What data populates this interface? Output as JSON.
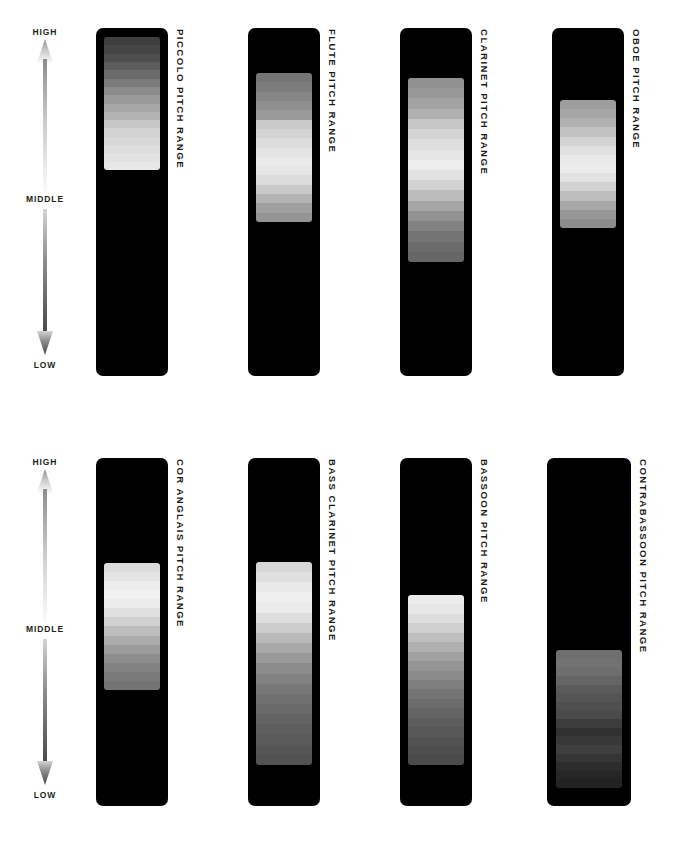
{
  "figure": {
    "background_color": "#ffffff",
    "card_color": "#000000",
    "label_color": "#1a1a1a"
  },
  "axis": {
    "high_label": "HIGH",
    "middle_label": "MIDDLE",
    "low_label": "LOW",
    "up_arrow_icon": "arrow-up-icon",
    "down_arrow_icon": "arrow-down-icon",
    "up_arrow_gradient": [
      "#8c8c8c",
      "#fdfdfd"
    ],
    "down_arrow_gradient": [
      "#d9d9d9",
      "#4a4a4a"
    ]
  },
  "chart_data": {
    "type": "bar",
    "subtitle": "Relative pitch span of each woodwind instrument",
    "xlabel": "",
    "ylabel": "Pitch",
    "grid": false,
    "legend": "none",
    "orientation": "vertical",
    "scale_labels": [
      "HIGH",
      "MIDDLE",
      "LOW"
    ],
    "ylim": [
      0,
      100
    ],
    "categories": [
      "PICCOLO",
      "FLUTE",
      "CLARINET",
      "OBOE",
      "COR ANGLAIS",
      "BASS CLARINET",
      "BASSOON",
      "CONTRABASSOON"
    ],
    "series": [
      {
        "name": "range_top_pct",
        "values": [
          97,
          87,
          86,
          79,
          70,
          70,
          61,
          45
        ]
      },
      {
        "name": "range_bottom_pct",
        "values": [
          59,
          44,
          33,
          42,
          33,
          12,
          12,
          4
        ]
      },
      {
        "name": "range_span_pct",
        "values": [
          38,
          43,
          53,
          37,
          37,
          58,
          49,
          41
        ]
      }
    ]
  },
  "row1": {
    "axis": {
      "high_label": "HIGH",
      "middle_label": "MIDDLE",
      "low_label": "LOW"
    },
    "instruments": [
      {
        "id": "piccolo",
        "label": "PICCOLO PITCH RANGE",
        "name": "PICCOLO",
        "card": {
          "x": 96,
          "y": 28,
          "w": 72,
          "h": 348
        },
        "bar": {
          "x": 8,
          "y": 9,
          "w": 56,
          "h": 133
        },
        "bands": [
          "#3e3e3e",
          "#454545",
          "#4e4e4e",
          "#5c5c5c",
          "#6b6b6b",
          "#7b7b7b",
          "#8b8b8b",
          "#9a9a9a",
          "#a7a7a7",
          "#b3b3b3",
          "#c7c7c7",
          "#d2d2d2",
          "#d8d8d8",
          "#dddddd",
          "#e2e2e2",
          "#e8e8e8"
        ]
      },
      {
        "id": "flute",
        "label": "FLUTE PITCH RANGE",
        "name": "FLUTE",
        "card": {
          "x": 248,
          "y": 28,
          "w": 72,
          "h": 348
        },
        "bar": {
          "x": 8,
          "y": 45,
          "w": 56,
          "h": 149
        },
        "bands": [
          "#757575",
          "#7c7c7c",
          "#868686",
          "#8f8f8f",
          "#9a9a9a",
          "#cacaca",
          "#d4d4d4",
          "#dddddd",
          "#e4e4e4",
          "#eaeaea",
          "#e6e6e6",
          "#dcdcdc",
          "#c9c9c9",
          "#b4b4b4",
          "#a0a0a0",
          "#949494"
        ]
      },
      {
        "id": "clarinet",
        "label": "CLARINET PITCH RANGE",
        "name": "CLARINET",
        "card": {
          "x": 400,
          "y": 28,
          "w": 72,
          "h": 348
        },
        "bar": {
          "x": 8,
          "y": 50,
          "w": 56,
          "h": 184
        },
        "bands": [
          "#909090",
          "#989898",
          "#a3a3a3",
          "#b0b0b0",
          "#c6c6c6",
          "#d4d4d4",
          "#dedede",
          "#e6e6e6",
          "#ededed",
          "#e2e2e2",
          "#d2d2d2",
          "#bcbcbc",
          "#a6a6a6",
          "#929292",
          "#828282",
          "#747474",
          "#6b6b6b",
          "#666666"
        ]
      },
      {
        "id": "oboe",
        "label": "OBOE PITCH RANGE",
        "name": "OBOE",
        "card": {
          "x": 552,
          "y": 28,
          "w": 72,
          "h": 348
        },
        "bar": {
          "x": 8,
          "y": 72,
          "w": 56,
          "h": 128
        },
        "bands": [
          "#9d9d9d",
          "#a6a6a6",
          "#b1b1b1",
          "#c2c2c2",
          "#d3d3d3",
          "#e0e0e0",
          "#e9e9e9",
          "#ececec",
          "#e2e2e2",
          "#d2d2d2",
          "#bdbdbd",
          "#a8a8a8",
          "#979797",
          "#8c8c8c"
        ]
      }
    ]
  },
  "row2": {
    "axis": {
      "high_label": "HIGH",
      "middle_label": "MIDDLE",
      "low_label": "LOW"
    },
    "instruments": [
      {
        "id": "cor-anglais",
        "label": "COR ANGLAIS PITCH RANGE",
        "name": "COR ANGLAIS",
        "card": {
          "x": 96,
          "y": 28,
          "w": 72,
          "h": 348
        },
        "bar": {
          "x": 8,
          "y": 105,
          "w": 56,
          "h": 127
        },
        "bands": [
          "#dcdcdc",
          "#e4e4e4",
          "#ececec",
          "#f1f1f1",
          "#ececec",
          "#e0e0e0",
          "#d0d0d0",
          "#bdbdbd",
          "#ababab",
          "#9b9b9b",
          "#8d8d8d",
          "#828282",
          "#7a7a7a",
          "#747474"
        ]
      },
      {
        "id": "bass-clarinet",
        "label": "BASS CLARINET PITCH RANGE",
        "name": "BASS CLARINET",
        "card": {
          "x": 248,
          "y": 28,
          "w": 72,
          "h": 348
        },
        "bar": {
          "x": 8,
          "y": 104,
          "w": 56,
          "h": 203
        },
        "bands": [
          "#d6d6d6",
          "#e0e0e0",
          "#e9e9e9",
          "#efefef",
          "#ebebeb",
          "#dedede",
          "#cccccc",
          "#b9b9b9",
          "#a8a8a8",
          "#999999",
          "#8c8c8c",
          "#818181",
          "#787878",
          "#707070",
          "#696969",
          "#636363",
          "#5e5e5e",
          "#5a5a5a",
          "#565656",
          "#525252"
        ]
      },
      {
        "id": "bassoon",
        "label": "BASSOON PITCH RANGE",
        "name": "BASSOON",
        "card": {
          "x": 400,
          "y": 28,
          "w": 72,
          "h": 348
        },
        "bar": {
          "x": 8,
          "y": 137,
          "w": 56,
          "h": 170
        },
        "bands": [
          "#ebebeb",
          "#e7e7e7",
          "#dddddd",
          "#cfcfcf",
          "#bfbfbf",
          "#b0b0b0",
          "#a2a2a2",
          "#959595",
          "#8a8a8a",
          "#7f7f7f",
          "#757575",
          "#6c6c6c",
          "#646464",
          "#5d5d5d",
          "#575757",
          "#525252",
          "#4e4e4e",
          "#4a4a4a"
        ]
      },
      {
        "id": "contrabassoon",
        "label": "CONTRABASSOON PITCH RANGE",
        "name": "CONTRABASSOON",
        "card": {
          "x": 547,
          "y": 28,
          "w": 84,
          "h": 348
        },
        "bar": {
          "x": 9,
          "y": 192,
          "w": 66,
          "h": 138
        },
        "bands": [
          "#6f6f6f",
          "#737373",
          "#6e6e6e",
          "#656565",
          "#5b5b5b",
          "#555555",
          "#4f4f4f",
          "#4a4a4a",
          "#3c3c3c",
          "#303030",
          "#383838",
          "#3f3f3f",
          "#353535",
          "#2c2c2c",
          "#262626",
          "#222222"
        ]
      }
    ]
  }
}
